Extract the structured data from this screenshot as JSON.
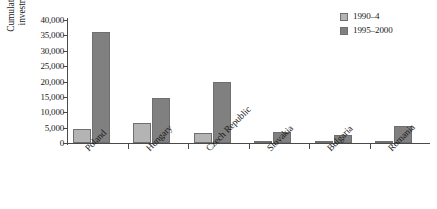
{
  "chart_data": {
    "type": "bar",
    "title": "",
    "subtitle": "",
    "xlabel": "",
    "ylabel_line1": "Cumulative foreign direct",
    "ylabel_line2": "investment (million $)",
    "categories": [
      "Poland",
      "Hungary",
      "Czech Republic",
      "Slovakia",
      "Bulgaria",
      "Romania"
    ],
    "series": [
      {
        "name": "1990–4",
        "values": [
          4500,
          6400,
          3300,
          400,
          200,
          400
        ]
      },
      {
        "name": "1995–2000",
        "values": [
          36000,
          14700,
          20000,
          3500,
          2700,
          5500
        ]
      }
    ],
    "ylim": [
      0,
      40000
    ],
    "ytick_values": [
      0,
      5000,
      10000,
      15000,
      20000,
      25000,
      30000,
      35000,
      40000
    ],
    "ytick_labels": [
      "0",
      "5,000",
      "10,000",
      "15,000",
      "20,000",
      "25,000",
      "30,000",
      "35,000",
      "40,000"
    ],
    "grid": false,
    "legend_position": "top-right",
    "colors": {
      "series_0": "#b4b4b4",
      "series_1": "#808080",
      "bar_border": "#6f6f6f",
      "axis": "#4a4a4a",
      "text": "#1a1a1a",
      "background": "#ffffff"
    }
  }
}
